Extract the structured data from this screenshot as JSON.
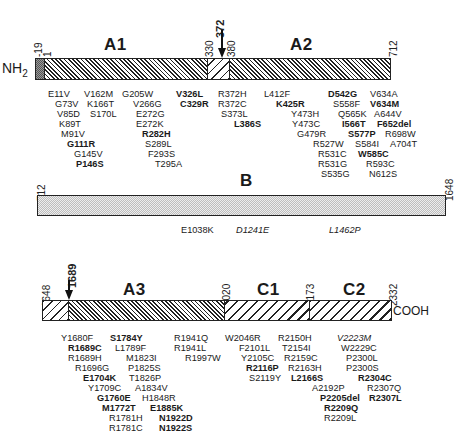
{
  "figure": {
    "n_terminus": "NH",
    "n_terminus_sub": "2",
    "c_terminus": "COOH"
  },
  "rows": [
    {
      "id": "top",
      "domains": [
        {
          "label": "A1",
          "start": 1,
          "end": 330,
          "pattern": "dense-hatch"
        },
        {
          "label": "A2",
          "start": 380,
          "end": 712,
          "pattern": "dense-hatch"
        }
      ],
      "segments": [
        {
          "name": "signal-peptide",
          "start": -19,
          "end": 1,
          "pattern": "dark-stipple"
        },
        {
          "name": "a1",
          "start": 1,
          "end": 330,
          "pattern": "dense-hatch"
        },
        {
          "name": "a1-a2-linker",
          "start": 330,
          "end": 380,
          "pattern": "light-hatch"
        },
        {
          "name": "a2",
          "start": 380,
          "end": 712,
          "pattern": "dense-hatch"
        }
      ],
      "position_labels": [
        "-19",
        "1",
        "330",
        "380",
        "712"
      ],
      "arrow_label": "372"
    },
    {
      "id": "middle",
      "domains": [
        {
          "label": "B",
          "start": 712,
          "end": 1648,
          "pattern": "stipple"
        }
      ],
      "position_labels": [
        "712",
        "1648"
      ]
    },
    {
      "id": "bottom",
      "domains": [
        {
          "label": "A3",
          "start": 1689,
          "end": 2020,
          "pattern": "dense-hatch"
        },
        {
          "label": "C1",
          "start": 2020,
          "end": 2173,
          "pattern": "wide-hatch"
        },
        {
          "label": "C2",
          "start": 2173,
          "end": 2332,
          "pattern": "wide-hatch"
        }
      ],
      "position_labels": [
        "1648",
        "2020",
        "2173",
        "2332"
      ],
      "arrow_label": "1689"
    }
  ],
  "mutations": {
    "a1_col1": [
      {
        "t": "E11V"
      },
      {
        "t": "G73V"
      },
      {
        "t": "V85D"
      },
      {
        "t": "K89T"
      },
      {
        "t": "M91V"
      },
      {
        "t": "G111R",
        "bold": true
      },
      {
        "t": "G145V"
      },
      {
        "t": "P146S",
        "bold": true
      }
    ],
    "a1_col2": [
      {
        "t": "V162M"
      },
      {
        "t": "K166T"
      },
      {
        "t": "S170L"
      }
    ],
    "a1_col3": [
      {
        "t": "G205W"
      },
      {
        "t": "V266G"
      },
      {
        "t": "E272G"
      },
      {
        "t": "E272K"
      },
      {
        "t": "R282H",
        "bold": true
      },
      {
        "t": "S289L"
      },
      {
        "t": "F293S"
      },
      {
        "t": "T295A"
      }
    ],
    "a1_col4": [
      {
        "t": "V326L",
        "bold": true
      },
      {
        "t": "C329R",
        "bold": true
      }
    ],
    "a2_col1": [
      {
        "t": "R372H"
      },
      {
        "t": "R372C"
      },
      {
        "t": "S373L"
      },
      {
        "t": "L386S",
        "bold": true
      }
    ],
    "a2_col2": [
      {
        "t": "L412F"
      },
      {
        "t": "K425R",
        "bold": true
      },
      {
        "t": "Y473H"
      },
      {
        "t": "Y473C"
      },
      {
        "t": "G479R"
      },
      {
        "t": "R527W"
      },
      {
        "t": "R531C"
      },
      {
        "t": "R531G"
      },
      {
        "t": "S535G"
      }
    ],
    "a2_col3": [
      {
        "t": "D542G",
        "bold": true
      },
      {
        "t": "S558F"
      },
      {
        "t": "Q565K"
      },
      {
        "t": "I566T",
        "bold": true
      },
      {
        "t": "S577P",
        "bold": true
      },
      {
        "t": "S584I"
      },
      {
        "t": "W585C",
        "bold": true
      },
      {
        "t": "R593C"
      },
      {
        "t": "N612S"
      }
    ],
    "a2_col4": [
      {
        "t": "V634A"
      },
      {
        "t": "V634M",
        "bold": true
      },
      {
        "t": "A644V"
      },
      {
        "t": "F652del",
        "bold": true
      },
      {
        "t": "R698W"
      },
      {
        "t": "A704T"
      }
    ],
    "b": [
      {
        "t": "E1038K"
      },
      {
        "t": "D1241E",
        "italic": true
      },
      {
        "t": "L1462P",
        "italic": true
      }
    ],
    "a3_col1": [
      {
        "t": "Y1680F"
      },
      {
        "t": "R1689C",
        "bold": true
      },
      {
        "t": "R1689H"
      },
      {
        "t": "R1696G"
      },
      {
        "t": "E1704K",
        "bold": true
      },
      {
        "t": "Y1709C"
      },
      {
        "t": "G1760E",
        "bold": true
      },
      {
        "t": "M1772T",
        "bold": true
      },
      {
        "t": "R1781H"
      },
      {
        "t": "R1781C"
      }
    ],
    "a3_col2": [
      {
        "t": "S1784Y",
        "bold": true
      },
      {
        "t": "L1789F"
      },
      {
        "t": "M1823I"
      },
      {
        "t": "P1825S"
      },
      {
        "t": "T1826P"
      },
      {
        "t": "A1834V"
      },
      {
        "t": "H1848R"
      },
      {
        "t": "E1885K",
        "bold": true
      },
      {
        "t": "N1922D",
        "bold": true
      },
      {
        "t": "N1922S",
        "bold": true
      }
    ],
    "a3_col3": [
      {
        "t": "R1941Q"
      },
      {
        "t": "R1941L"
      },
      {
        "t": "R1997W"
      }
    ],
    "c1_col1": [
      {
        "t": "W2046R"
      },
      {
        "t": "F2101L"
      },
      {
        "t": "Y2105C"
      },
      {
        "t": "R2116P",
        "bold": true
      },
      {
        "t": "S2119Y"
      }
    ],
    "c1_col2": [
      {
        "t": "R2150H"
      },
      {
        "t": "T2154I"
      },
      {
        "t": "R2159C"
      },
      {
        "t": "R2163H"
      },
      {
        "t": "L2166S",
        "bold": true
      }
    ],
    "c2_col1": [
      {
        "t": "A2192P"
      },
      {
        "t": "P2205del",
        "bold": true
      },
      {
        "t": "R2209Q",
        "bold": true
      },
      {
        "t": "R2209L"
      }
    ],
    "c2_col2": [
      {
        "t": "V2223M",
        "italic": true
      },
      {
        "t": "W2229C"
      },
      {
        "t": "P2300L"
      },
      {
        "t": "P2300S"
      },
      {
        "t": "R2304C",
        "bold": true
      },
      {
        "t": "R2307Q"
      },
      {
        "t": "R2307L",
        "bold": true
      }
    ]
  }
}
